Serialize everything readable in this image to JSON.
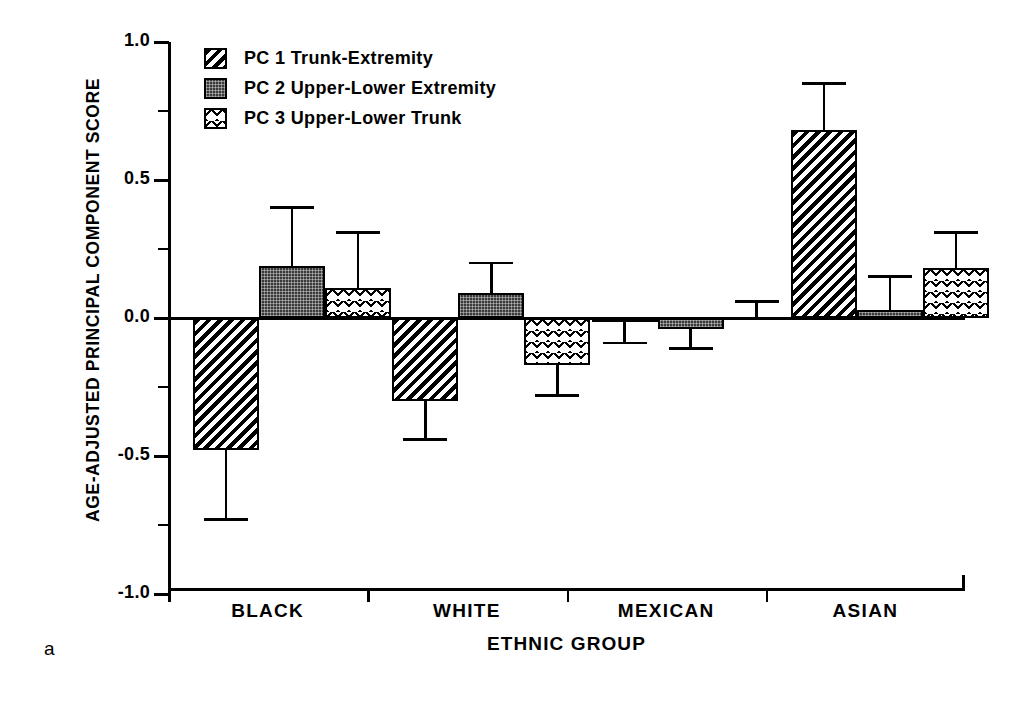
{
  "panel_letter": "a",
  "axes": {
    "ylabel": "AGE-ADJUSTED PRINCIPAL COMPONENT SCORE",
    "xlabel": "ETHNIC GROUP",
    "ytick_labels": [
      "1.0",
      "0.5",
      "0.0",
      "-0.5",
      "-1.0"
    ]
  },
  "legend": {
    "items": [
      {
        "label": "PC 1 Trunk-Extremity",
        "pattern": "diagonal-hatch-icon"
      },
      {
        "label": "PC 2 Upper-Lower Extremity",
        "pattern": "dark-stipple-icon"
      },
      {
        "label": "PC 3 Upper-Lower Trunk",
        "pattern": "light-crosshatch-icon"
      }
    ]
  },
  "chart_data": {
    "type": "bar",
    "title": "",
    "xlabel": "ETHNIC GROUP",
    "ylabel": "AGE-ADJUSTED PRINCIPAL COMPONENT SCORE",
    "ylim": [
      -1.0,
      1.0
    ],
    "yticks": [
      1.0,
      0.5,
      0.0,
      -0.5,
      -1.0
    ],
    "yminorticks": [
      0.75,
      0.25,
      -0.25,
      -0.75
    ],
    "grid": false,
    "legend_position": "top-left",
    "categories": [
      "BLACK",
      "WHITE",
      "MEXICAN",
      "ASIAN"
    ],
    "series": [
      {
        "name": "PC 1 Trunk-Extremity",
        "pattern": "diagonal-hatch",
        "values": [
          -0.48,
          -0.3,
          -0.01,
          0.68
        ],
        "error_bounds": [
          -0.73,
          -0.44,
          -0.09,
          0.85
        ]
      },
      {
        "name": "PC 2 Upper-Lower Extremity",
        "pattern": "dark-stipple",
        "values": [
          0.19,
          0.09,
          -0.04,
          0.03
        ],
        "error_bounds": [
          0.4,
          0.2,
          -0.11,
          0.15
        ]
      },
      {
        "name": "PC 3 Upper-Lower Trunk",
        "pattern": "light-crosshatch",
        "values": [
          0.11,
          -0.17,
          0.0,
          0.18
        ],
        "error_bounds": [
          0.31,
          -0.28,
          0.06,
          0.31
        ]
      }
    ]
  }
}
